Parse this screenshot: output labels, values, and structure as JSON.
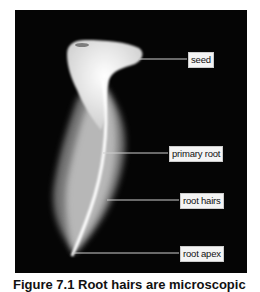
{
  "figure": {
    "labels": {
      "seed": "seed",
      "primary_root": "primary root",
      "root_hairs": "root hairs",
      "root_apex": "root apex"
    },
    "caption": "Figure 7.1  Root hairs are microscopic"
  }
}
